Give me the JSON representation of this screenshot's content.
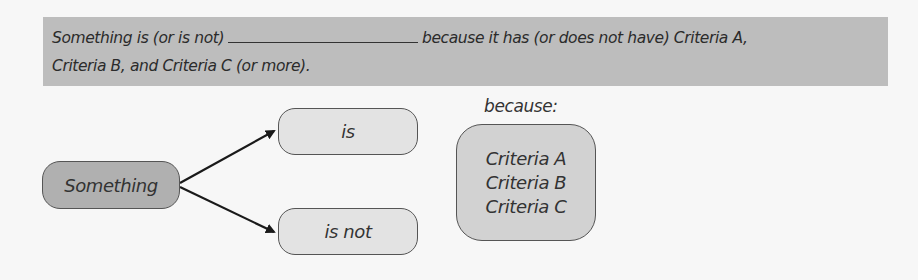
{
  "banner": {
    "line1_before_blank": "Something is (or is not)",
    "line1_after_blank": "because it has (or does not have) Criteria A,",
    "line2": "Criteria B, and Criteria C (or more)."
  },
  "diagram": {
    "root": {
      "label": "Something"
    },
    "branches": [
      {
        "label": "is"
      },
      {
        "label": "is not"
      }
    ],
    "because_label": "because:",
    "criteria": [
      "Criteria A",
      "Criteria B",
      "Criteria C"
    ],
    "colors": {
      "banner_fill": "#bdbdbd",
      "root_fill": "#b0b0b0",
      "branch_fill": "#e3e3e3",
      "criteria_fill": "#d2d2d2",
      "stroke": "#555555",
      "arrow": "#1a1a1a"
    }
  }
}
